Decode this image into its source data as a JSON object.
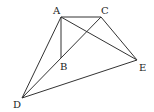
{
  "diagram": {
    "points": [
      {
        "id": "A",
        "label": "A",
        "x": 61,
        "y": 17,
        "lx": 53,
        "ly": 14
      },
      {
        "id": "C",
        "label": "C",
        "x": 101,
        "y": 17,
        "lx": 101,
        "ly": 14
      },
      {
        "id": "B",
        "label": "B",
        "x": 61,
        "y": 58,
        "lx": 60,
        "ly": 70
      },
      {
        "id": "E",
        "label": "E",
        "x": 137,
        "y": 60,
        "lx": 139,
        "ly": 71
      },
      {
        "id": "D",
        "label": "D",
        "x": 22,
        "y": 98,
        "lx": 13,
        "ly": 108
      }
    ],
    "segments": [
      [
        "A",
        "C"
      ],
      [
        "A",
        "B"
      ],
      [
        "A",
        "D"
      ],
      [
        "A",
        "E"
      ],
      [
        "C",
        "D"
      ],
      [
        "C",
        "E"
      ],
      [
        "D",
        "E"
      ]
    ]
  }
}
